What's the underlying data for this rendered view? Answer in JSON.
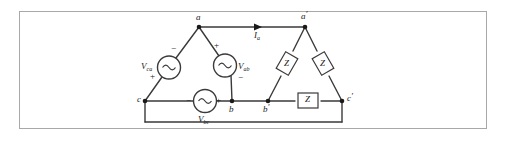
{
  "figure": {
    "background": "#ffffff",
    "border_color": "#a8a8a8",
    "wire_color": "#3a3a3a",
    "text_color": "#1a1a1a"
  },
  "source_nodes": {
    "a": "a",
    "b": "b",
    "c": "c"
  },
  "load_nodes": {
    "a_prime_base": "a",
    "a_prime_mark": "′",
    "b_prime_base": "b",
    "b_prime_mark": "′",
    "c_prime_base": "c",
    "c_prime_mark": "′"
  },
  "sources": [
    {
      "name": "source-ca",
      "symbol_base": "V",
      "symbol_sub": "ca",
      "glyph": "∿",
      "terminal_top": "−",
      "terminal_bottom": "+",
      "position": "left-leg"
    },
    {
      "name": "source-ab",
      "symbol_base": "V",
      "symbol_sub": "ab",
      "glyph": "∿",
      "terminal_top": "+",
      "terminal_bottom": "−",
      "position": "right-leg"
    },
    {
      "name": "source-bc",
      "symbol_base": "V",
      "symbol_sub": "bc",
      "glyph": "∿",
      "terminal_left": "−",
      "terminal_right": "+",
      "position": "bottom-leg"
    }
  ],
  "impedances": [
    {
      "name": "impedance-a-b",
      "label": "Z",
      "orientation": "diamond",
      "position": "left-leg"
    },
    {
      "name": "impedance-a-c",
      "label": "Z",
      "orientation": "diamond",
      "position": "right-leg"
    },
    {
      "name": "impedance-b-c",
      "label": "Z",
      "orientation": "square",
      "position": "bottom-leg"
    }
  ],
  "current": {
    "name": "line-current-a",
    "symbol_base": "I",
    "symbol_sub": "a",
    "arrow": "▶",
    "direction": "right"
  }
}
